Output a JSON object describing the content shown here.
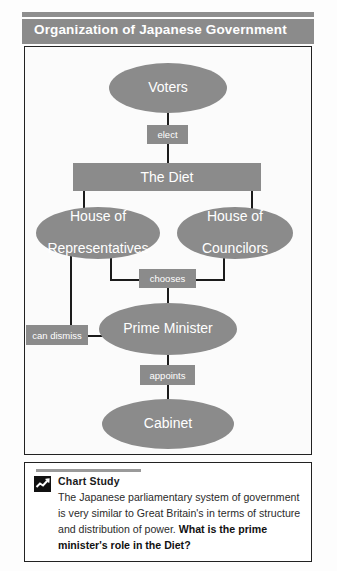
{
  "header": {
    "title": "Organization of Japanese Government"
  },
  "diagram": {
    "nodes": {
      "voters": "Voters",
      "diet": "The Diet",
      "house_of_representatives_line1": "House of",
      "house_of_representatives_line2": "Representatives",
      "house_of_councilors_line1": "House of",
      "house_of_councilors_line2": "Councilors",
      "prime_minister": "Prime Minister",
      "cabinet": "Cabinet"
    },
    "edge_labels": {
      "elect": "elect",
      "chooses": "chooses",
      "can_dismiss": "can dismiss",
      "appoints": "appoints"
    },
    "colors": {
      "node_fill": "#8b8b8b",
      "node_text": "#ffffff",
      "connector": "#1b1b1b",
      "panel_background": "#fbfbfb",
      "panel_border": "#222222"
    }
  },
  "chart_study": {
    "icon": "line-chart-icon",
    "heading": "Chart Study",
    "text_part1": "The Japanese parliamentary system of government is very similar to Great Britain's in terms of structure and distribution of power. ",
    "text_question": "What is the prime minister's role in the Diet?"
  }
}
